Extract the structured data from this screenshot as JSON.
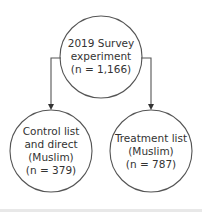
{
  "diagram": {
    "root": {
      "lines": [
        "2019 Survey",
        "experiment",
        "(n = 1,166)"
      ]
    },
    "children": [
      {
        "lines": [
          "Control list",
          "and direct",
          "(Muslim)",
          "(n = 379)"
        ]
      },
      {
        "lines": [
          "Treatment list",
          "(Muslim)",
          "(n = 787)"
        ]
      }
    ],
    "colors": {
      "stroke": "#555555",
      "text": "#333333"
    }
  }
}
